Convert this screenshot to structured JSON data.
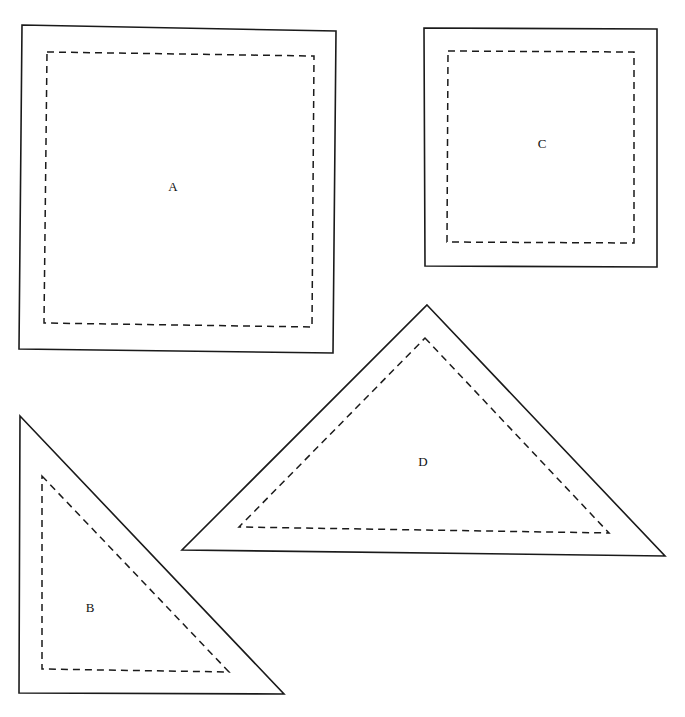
{
  "diagram": {
    "shapes": [
      {
        "id": "A",
        "label": "A",
        "type": "square",
        "outer_points": "22,25 336,31 333,353 19,349",
        "inner_points": "47,52 314,56 312,327 44,323",
        "label_x": 173,
        "label_y": 188
      },
      {
        "id": "C",
        "label": "C",
        "type": "square",
        "outer_points": "424,28 657,29 657,267 425,266",
        "inner_points": "448,51 634,52 634,243 447,242",
        "label_x": 542,
        "label_y": 145
      },
      {
        "id": "B",
        "label": "B",
        "type": "right-triangle",
        "outer_points": "20,416 284,694 19,693",
        "inner_points": "42,476 229,672 42,669",
        "label_x": 90,
        "label_y": 609
      },
      {
        "id": "D",
        "label": "D",
        "type": "triangle",
        "outer_points": "427,305 665,556 182,550",
        "inner_points": "425,338 609,533 239,527",
        "label_x": 423,
        "label_y": 463
      }
    ],
    "colors": {
      "stroke": "#1a1a1a",
      "background": "#ffffff"
    }
  }
}
